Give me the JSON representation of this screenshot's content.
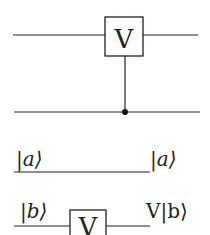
{
  "diagram": {
    "type": "quantum-circuit",
    "controlled_gate": {
      "gate_label": "V",
      "target_wire": "top",
      "control_wire": "bottom"
    },
    "equivalent_circuits": {
      "wire_a": {
        "input_label": "|a⟩",
        "output_label": "|a⟩"
      },
      "wire_b": {
        "input_label": "|b⟩",
        "gate_label": "V",
        "output_label": "V|b⟩"
      }
    }
  }
}
